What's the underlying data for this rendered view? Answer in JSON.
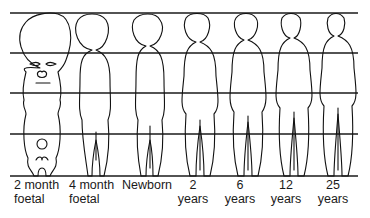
{
  "diagram": {
    "line_color": "#1a1a1a",
    "grid_lines_count": 5,
    "stages": [
      {
        "id": "2-month-foetal",
        "line1": "2 month",
        "line2": "foetal"
      },
      {
        "id": "4-month-foetal",
        "line1": "4 month",
        "line2": "foetal"
      },
      {
        "id": "newborn",
        "line1": "Newborn",
        "line2": ""
      },
      {
        "id": "2-years",
        "line1": "2",
        "line2": "years"
      },
      {
        "id": "6-years",
        "line1": "6",
        "line2": "years"
      },
      {
        "id": "12-years",
        "line1": "12",
        "line2": "years"
      },
      {
        "id": "25-years",
        "line1": "25",
        "line2": "years"
      }
    ]
  }
}
